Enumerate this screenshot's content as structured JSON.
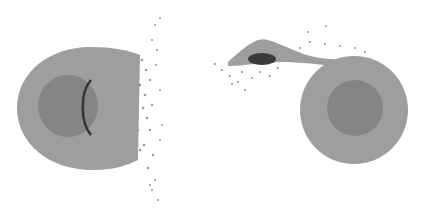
{
  "figure": {
    "panels": [
      {
        "name": "left-panel",
        "content": "layered body with mantle and core, ejecta spraying to the right, dark curved fracture line"
      },
      {
        "name": "right-panel",
        "content": "layered sphere with debris tail extending up-left to a small dark fragment"
      }
    ],
    "colors": {
      "mantle": "#9a9a9a",
      "core": "#7e7e7e",
      "fragment": "#3a3a3a",
      "background": "#ffffff"
    }
  }
}
